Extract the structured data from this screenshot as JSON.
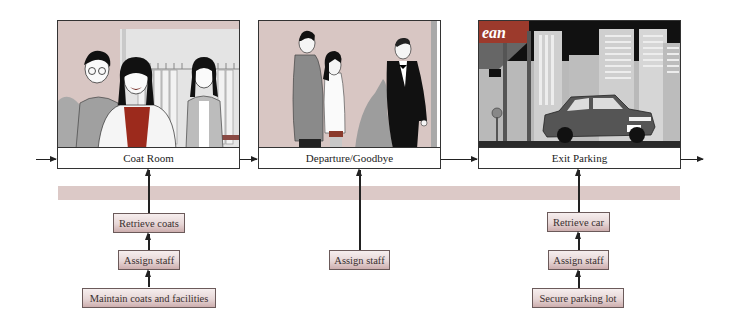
{
  "diagram": {
    "type": "service-blueprint",
    "colors": {
      "band": "#dcc9c7",
      "task_box_top": "#f6eeee",
      "task_box_bottom": "#cdaeae",
      "accent_red": "#9c2a1c",
      "scene_background": "#d9c7c3"
    },
    "stages": [
      {
        "label": "Coat Room",
        "illustration": "staff helping woman with coat in coat room",
        "support_tasks": [
          "Retrieve coats",
          "Assign staff",
          "Maintain coats and facilities"
        ]
      },
      {
        "label": "Departure/Goodbye",
        "illustration": "doorman in tuxedo bidding couple goodbye",
        "support_tasks": [
          "Assign staff"
        ]
      },
      {
        "label": "Exit Parking",
        "illustration": "car in parking lot with city skyline",
        "sign_text": "ean",
        "support_tasks": [
          "Retrieve car",
          "Assign staff",
          "Secure parking lot"
        ]
      }
    ]
  }
}
